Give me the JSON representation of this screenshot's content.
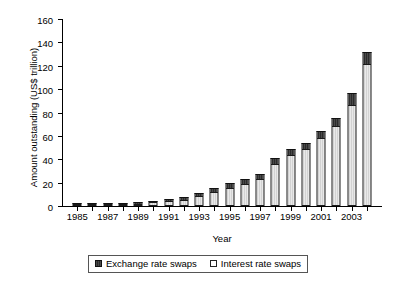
{
  "chart_data": {
    "type": "bar",
    "stacked": true,
    "title": "",
    "xlabel": "Year",
    "ylabel": "Amount outstanding (US$ trillion)",
    "categories": [
      "1985",
      "1986",
      "1987",
      "1988",
      "1989",
      "1990",
      "1991",
      "1992",
      "1993",
      "1994",
      "1995",
      "1996",
      "1997",
      "1998",
      "1999",
      "2000",
      "2001",
      "2002",
      "2003",
      "2004"
    ],
    "xtick_labels": [
      "1985",
      "1987",
      "1989",
      "1991",
      "1993",
      "1995",
      "1997",
      "1999",
      "2001",
      "2003"
    ],
    "ytick_labels": [
      "0",
      "20",
      "40",
      "60",
      "80",
      "100",
      "120",
      "140",
      "160"
    ],
    "yticks": [
      0,
      20,
      40,
      60,
      80,
      100,
      120,
      140,
      160
    ],
    "ylim": [
      0,
      160
    ],
    "grid": false,
    "legend_position": "bottom",
    "series": [
      {
        "name": "Interest rate swaps",
        "color": "#ffffff",
        "values": [
          0.3,
          0.8,
          1.1,
          1.6,
          2.0,
          3.1,
          4.2,
          5.4,
          8.8,
          12.0,
          15.6,
          19.2,
          23.5,
          36.3,
          43.9,
          48.8,
          58.3,
          68.3,
          86.8,
          121.5
        ]
      },
      {
        "name": "Exchange rate swaps",
        "color": "#333333",
        "values": [
          0.3,
          0.4,
          0.6,
          0.8,
          0.9,
          1.3,
          1.6,
          1.9,
          2.4,
          3.2,
          3.8,
          4.0,
          4.3,
          4.5,
          4.7,
          5.4,
          5.9,
          7.1,
          9.8,
          10.5
        ]
      }
    ],
    "totals": [
      0.6,
      1.2,
      1.7,
      2.4,
      2.9,
      4.4,
      5.8,
      7.3,
      11.2,
      15.2,
      19.4,
      23.2,
      27.8,
      40.8,
      48.6,
      54.2,
      64.2,
      75.4,
      96.6,
      132.0
    ]
  },
  "legend": {
    "items": [
      {
        "label": "Exchange rate swaps",
        "swatch": "dark"
      },
      {
        "label": "Interest rate swaps",
        "swatch": "light"
      }
    ]
  }
}
